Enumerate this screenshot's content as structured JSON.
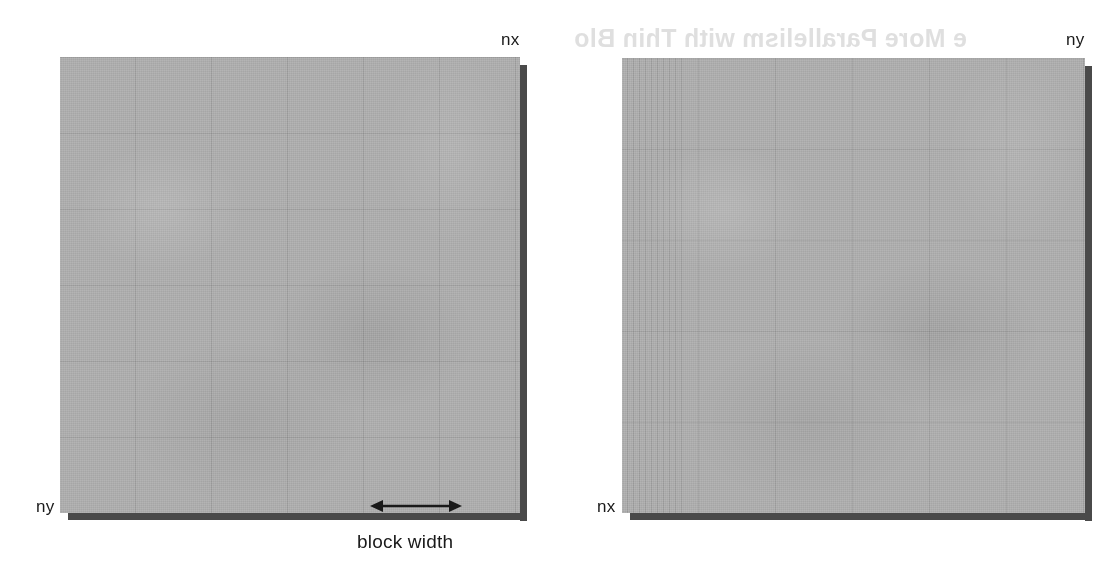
{
  "figure": {
    "type": "diagram",
    "background_color": "#ffffff",
    "grid_fill_color": "#adadad",
    "shadow_color": "#4a4a4a",
    "text_color": "#1a1a1a"
  },
  "bleed_through": {
    "heading": "e More Parallelism with Thin Blo",
    "note": "faint mirrored show-through from reverse side of scanned page",
    "color": "#cfcfcf"
  },
  "panels": [
    {
      "id": "left",
      "name": "wide-blocks-panel",
      "top_label": "nx",
      "left_label": "ny",
      "caption": "block width",
      "horizontal_axis": "nx",
      "vertical_axis": "ny",
      "block_columns": 6,
      "block_rows": 6,
      "description": "square domain divided into wide rectangular thread blocks"
    },
    {
      "id": "right",
      "name": "thin-blocks-panel",
      "top_label": "ny",
      "left_label": "nx",
      "caption": "",
      "horizontal_axis": "ny",
      "vertical_axis": "nx",
      "block_columns": 6,
      "block_rows": 5,
      "description": "transposed domain divided into many narrow thin thread blocks"
    }
  ],
  "annotations": {
    "block_width_arrow": {
      "name": "block-width-arrow",
      "style": "double-headed horizontal arrow",
      "label": "block width"
    }
  }
}
